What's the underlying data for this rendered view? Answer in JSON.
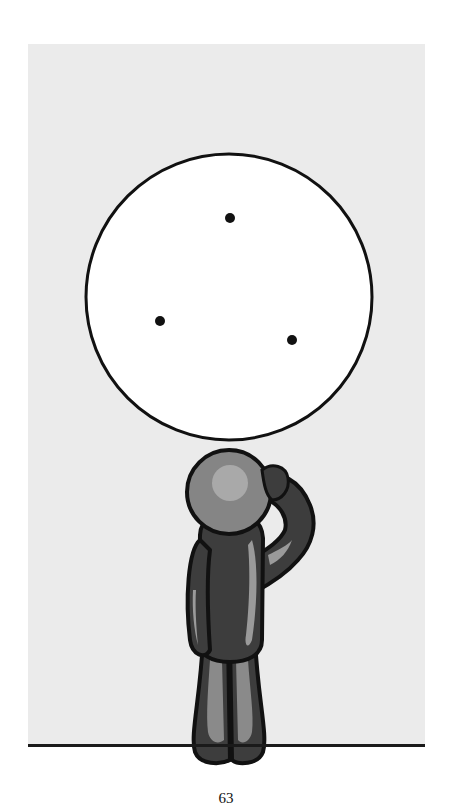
{
  "page": {
    "number": "63",
    "background": "#ffffff",
    "panel_color": "#ebebeb"
  },
  "illustration": {
    "circle": {
      "cx": 229,
      "cy": 297,
      "r": 143,
      "fill": "#ffffff",
      "stroke": "#111111"
    },
    "dots": [
      {
        "cx": 230,
        "cy": 218
      },
      {
        "cx": 160,
        "cy": 321
      },
      {
        "cx": 292,
        "cy": 340
      }
    ],
    "figure": {
      "pose": "scratching-head",
      "body_color": "#3d3d3d",
      "head_color": "#8a8a8a",
      "highlight_color": "#b5b5b5"
    }
  }
}
